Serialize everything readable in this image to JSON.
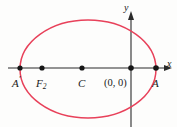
{
  "figure": {
    "type": "conic-section-diagram",
    "background_color": "#fdfdfc",
    "curve_color": "#e8415a",
    "axis_color": "#2b2b2b",
    "point_color": "#161616"
  },
  "axes": {
    "x_label": "x",
    "y_label": "y",
    "x_axis": {
      "y_pixel": 68,
      "x_start": 8,
      "x_end": 172,
      "arrow": "right"
    },
    "y_axis": {
      "x_pixel": 131,
      "y_start": 12,
      "y_end": 127,
      "arrow": "up"
    }
  },
  "ellipse": {
    "center_x": 88,
    "center_y": 69,
    "radius_x": 68,
    "radius_y": 49,
    "stroke_color": "#e8415a",
    "stroke_width": 1.4,
    "fill": "none"
  },
  "points": [
    {
      "id": "a-prime",
      "label": "A",
      "prime": "′",
      "x": 20,
      "y": 68,
      "label_x": 12,
      "label_y": 78
    },
    {
      "id": "f2",
      "label": "F",
      "subscript": "2",
      "x": 42,
      "y": 68,
      "label_x": 36,
      "label_y": 78
    },
    {
      "id": "c",
      "label": "C",
      "x": 82,
      "y": 68,
      "label_x": 78,
      "label_y": 78
    },
    {
      "id": "origin",
      "label": "(0, 0)",
      "x": 131,
      "y": 68,
      "label_x": 104,
      "label_y": 78
    },
    {
      "id": "a",
      "label": "A",
      "x": 156,
      "y": 68,
      "label_x": 152,
      "label_y": 78
    }
  ],
  "labels": {
    "a_prime_letter": "A",
    "a_prime_mark": "′",
    "f_letter": "F",
    "f_subscript": "2",
    "c_letter": "C",
    "origin_text": "(0, 0)",
    "a_letter": "A",
    "x_axis_text": "x",
    "y_axis_text": "y"
  }
}
